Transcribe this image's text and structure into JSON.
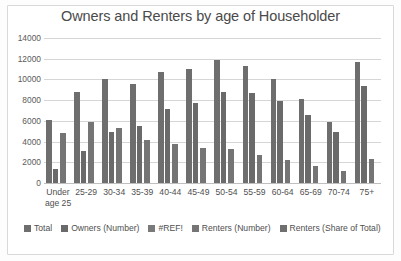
{
  "chart_data": {
    "type": "bar",
    "title": "Owners and Renters by age of Householder",
    "xlabel": "",
    "ylabel": "",
    "ylim": [
      0,
      14000
    ],
    "ytick_step": 2000,
    "yticks": [
      "14000",
      "12000",
      "10000",
      "8000",
      "6000",
      "4000",
      "2000",
      "0"
    ],
    "grid": true,
    "legend_position": "bottom",
    "categories": [
      "Under age 25",
      "25-29",
      "30-34",
      "35-39",
      "40-44",
      "45-49",
      "50-54",
      "55-59",
      "60-64",
      "65-69",
      "70-74",
      "75+"
    ],
    "series": [
      {
        "name": "Total",
        "color": "#6e6e6e",
        "values": [
          6100,
          8800,
          10000,
          9600,
          10700,
          11000,
          11900,
          11300,
          10000,
          8100,
          5900,
          11650
        ]
      },
      {
        "name": "Owners (Number)",
        "color": "#6a6a6a",
        "values": [
          1350,
          3050,
          4900,
          5500,
          7100,
          7750,
          8800,
          8650,
          7900,
          6600,
          4950,
          9400
        ]
      },
      {
        "name": "#REF!",
        "color": "#7a7a7a",
        "values": [
          0,
          0,
          0,
          0,
          0,
          0,
          0,
          0,
          0,
          0,
          0,
          0
        ]
      },
      {
        "name": "Renters (Number)",
        "color": "#757575",
        "values": [
          4850,
          5850,
          5300,
          4150,
          3800,
          3350,
          3250,
          2750,
          2200,
          1650,
          1200,
          2350
        ]
      },
      {
        "name": "Renters (Share of Total)",
        "color": "#6f6f6f",
        "values": [
          0,
          0,
          0,
          0,
          0,
          0,
          0,
          0,
          0,
          0,
          0,
          0
        ]
      }
    ]
  }
}
